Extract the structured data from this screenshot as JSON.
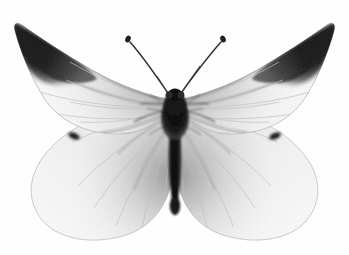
{
  "image": {
    "subject": "white butterfly specimen, wings spread, dorsal view",
    "common_name": "Cabbage White butterfly",
    "view": "dorsal spread specimen",
    "background_color": "#ffffff",
    "width": 349,
    "height": 255,
    "caption": ""
  },
  "colors": {
    "background": "#ffffff",
    "wing_membrane_light": "#fbfbfb",
    "wing_membrane_mid": "#f0f0f0",
    "wing_membrane_shade": "#e2e2e2",
    "wing_edge": "#b9b9b9",
    "vein_light": "#cfcfcf",
    "vein_dark": "#9a9a9a",
    "apex_black": "#1b1b1b",
    "apex_soft": "#4a4a4a",
    "body_black": "#141414",
    "body_mid": "#3a3a3a",
    "antenna": "#2b2b2b",
    "spot_black": "#232323"
  },
  "parts": [
    {
      "id": "left-forewing",
      "label": "Left forewing",
      "description": "large pale triangular wing with dark apex patch"
    },
    {
      "id": "right-forewing",
      "label": "Right forewing",
      "description": "large pale triangular wing with dark apex patch"
    },
    {
      "id": "left-hindwing",
      "label": "Left hindwing",
      "description": "rounded pale lower wing with small dark costal spot"
    },
    {
      "id": "right-hindwing",
      "label": "Right hindwing",
      "description": "rounded pale lower wing with small dark costal spot"
    },
    {
      "id": "thorax",
      "label": "Thorax",
      "description": "dark furry body segment at wing junction"
    },
    {
      "id": "abdomen",
      "label": "Abdomen",
      "description": "dark tapering body extending downward"
    },
    {
      "id": "head",
      "label": "Head",
      "description": "small dark head with eyes"
    },
    {
      "id": "left-antenna",
      "label": "Left antenna",
      "description": "thin dark antenna with clubbed tip"
    },
    {
      "id": "right-antenna",
      "label": "Right antenna",
      "description": "thin dark antenna with clubbed tip"
    },
    {
      "id": "left-wing-spot",
      "label": "Left hindwing costal spot",
      "description": "small black mark near hindwing leading edge"
    },
    {
      "id": "right-wing-spot",
      "label": "Right hindwing costal spot",
      "description": "small black mark near hindwing leading edge"
    }
  ]
}
